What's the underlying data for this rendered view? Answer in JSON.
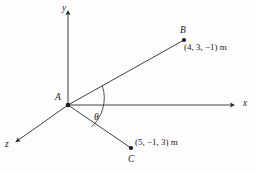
{
  "figure": {
    "background_color": "#fdfdfd",
    "line_color": "#2a2a2a"
  },
  "axes": [
    {
      "name": "y-axis",
      "label": "y",
      "direction": "up"
    },
    {
      "name": "x-axis",
      "label": "x",
      "direction": "right"
    },
    {
      "name": "z-axis",
      "label": "z",
      "direction": "lower-left"
    }
  ],
  "axis_labels": {
    "y": "y",
    "x": "x",
    "z": "z"
  },
  "points": {
    "origin": {
      "label": "A",
      "coords_text": ""
    },
    "b": {
      "label": "B",
      "coords_text": "(4, 3, −1) m"
    },
    "c": {
      "label": "C",
      "coords_text": "(5, −1, 3) m"
    }
  },
  "angle": {
    "label": "θ",
    "between": "AB and AC"
  }
}
